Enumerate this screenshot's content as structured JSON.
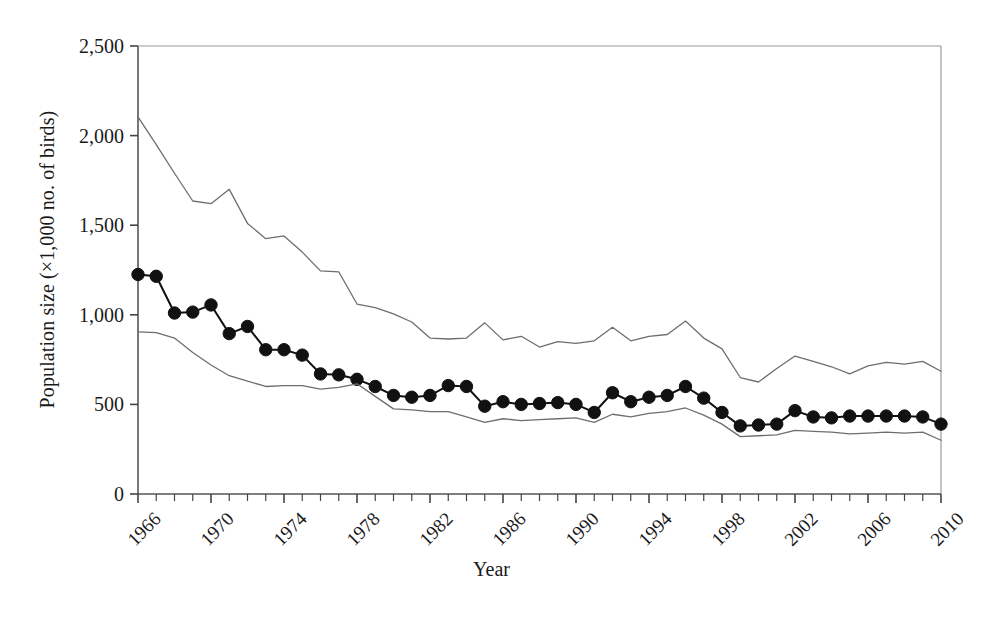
{
  "chart_data": {
    "type": "line",
    "title": "",
    "xlabel": "Year",
    "ylabel": "Population size (×1,000 no. of birds)",
    "xlim": [
      1966,
      2010
    ],
    "ylim": [
      0,
      2500
    ],
    "grid": false,
    "legend": "none",
    "ytick_labels": [
      "0",
      "500",
      "1,000",
      "1,500",
      "2,000",
      "2,500"
    ],
    "ytick_values": [
      0,
      500,
      1000,
      1500,
      2000,
      2500
    ],
    "xtick_labels": [
      "1966",
      "1970",
      "1974",
      "1978",
      "1982",
      "1986",
      "1990",
      "1994",
      "1998",
      "2002",
      "2006",
      "2010"
    ],
    "xtick_values": [
      1966,
      1970,
      1974,
      1978,
      1982,
      1986,
      1990,
      1994,
      1998,
      2002,
      2006,
      2010
    ],
    "xtick_minor_step": 1,
    "x": [
      1966,
      1967,
      1968,
      1969,
      1970,
      1971,
      1972,
      1973,
      1974,
      1975,
      1976,
      1977,
      1978,
      1979,
      1980,
      1981,
      1982,
      1983,
      1984,
      1985,
      1986,
      1987,
      1988,
      1989,
      1990,
      1991,
      1992,
      1993,
      1994,
      1995,
      1996,
      1997,
      1998,
      1999,
      2000,
      2001,
      2002,
      2003,
      2004,
      2005,
      2006,
      2007,
      2008,
      2009,
      2010
    ],
    "series": [
      {
        "name": "Population index",
        "style": "line-with-markers",
        "color": "#111111",
        "marker": "filled-circle",
        "values": [
          1225,
          1215,
          1010,
          1015,
          1055,
          895,
          935,
          805,
          805,
          775,
          670,
          665,
          640,
          600,
          550,
          540,
          550,
          605,
          600,
          490,
          515,
          500,
          505,
          510,
          500,
          455,
          565,
          515,
          540,
          550,
          600,
          535,
          455,
          380,
          385,
          390,
          465,
          430,
          425,
          435,
          435,
          435,
          435,
          430,
          390
        ]
      },
      {
        "name": "Upper confidence limit",
        "style": "line",
        "color": "#6e6e6e",
        "marker": "none",
        "values": [
          2105,
          1950,
          1790,
          1635,
          1620,
          1700,
          1510,
          1425,
          1440,
          1350,
          1245,
          1240,
          1060,
          1040,
          1005,
          960,
          870,
          865,
          870,
          955,
          860,
          880,
          820,
          850,
          840,
          855,
          930,
          855,
          880,
          890,
          965,
          870,
          810,
          650,
          625,
          700,
          770,
          740,
          710,
          670,
          715,
          735,
          725,
          740,
          685
        ]
      },
      {
        "name": "Lower confidence limit",
        "style": "line",
        "color": "#6e6e6e",
        "marker": "none",
        "values": [
          905,
          900,
          870,
          790,
          720,
          660,
          630,
          600,
          605,
          605,
          585,
          595,
          615,
          545,
          475,
          470,
          460,
          460,
          430,
          400,
          420,
          410,
          415,
          420,
          425,
          400,
          445,
          430,
          450,
          460,
          480,
          440,
          390,
          320,
          325,
          330,
          355,
          350,
          345,
          335,
          340,
          345,
          340,
          345,
          300
        ]
      }
    ]
  }
}
